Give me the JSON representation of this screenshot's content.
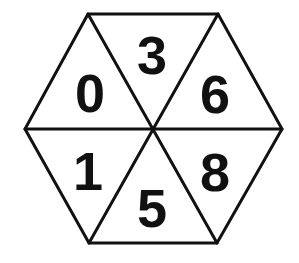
{
  "diagram": {
    "shape": "hexagon divided into 6 triangles",
    "colors": {
      "stroke": "#111111",
      "background": "#ffffff",
      "text": "#111111"
    },
    "vertices": {
      "top_left": [
        88,
        14
      ],
      "top_right": [
        218,
        14
      ],
      "right": [
        282,
        129
      ],
      "bottom_right": [
        217,
        243
      ],
      "bottom_left": [
        89,
        243
      ],
      "left": [
        25,
        129
      ],
      "center": [
        152,
        129
      ]
    },
    "segments": [
      {
        "position": "upper-left",
        "value": "0",
        "x": 90,
        "y": 112
      },
      {
        "position": "top",
        "value": "3",
        "x": 152,
        "y": 74
      },
      {
        "position": "upper-right",
        "value": "6",
        "x": 215,
        "y": 113
      },
      {
        "position": "lower-left",
        "value": "1",
        "x": 88,
        "y": 190
      },
      {
        "position": "bottom",
        "value": "5",
        "x": 152,
        "y": 227
      },
      {
        "position": "lower-right",
        "value": "8",
        "x": 215,
        "y": 191
      }
    ]
  }
}
